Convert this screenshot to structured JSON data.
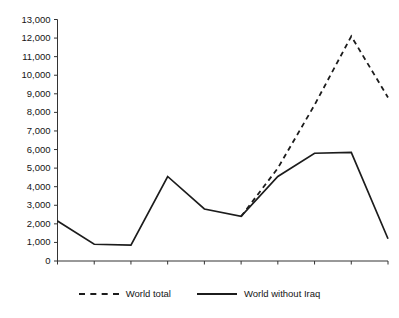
{
  "figure": {
    "clipped_caption": "",
    "background_color": "#ffffff",
    "ink_color": "#1c1c1c"
  },
  "legend": {
    "position": "bottom-center",
    "entries": [
      {
        "label": "World total",
        "style": "dashed",
        "swatch_name": "dashed-line-swatch"
      },
      {
        "label": "World without Iraq",
        "style": "solid",
        "swatch_name": "solid-line-swatch"
      }
    ]
  },
  "chart_data": {
    "type": "line",
    "title": "",
    "subtitle": "",
    "xlabel": "",
    "ylabel": "",
    "categories": [
      "1998",
      "1999",
      "2000",
      "2001",
      "2002",
      "2003",
      "2004",
      "2005",
      "2006",
      "2007"
    ],
    "x": [
      1998,
      1999,
      2000,
      2001,
      2002,
      2003,
      2004,
      2005,
      2006,
      2007
    ],
    "xlim": [
      1998,
      2007
    ],
    "ylim": [
      0,
      13000
    ],
    "ytick_values": [
      0,
      1000,
      2000,
      3000,
      4000,
      5000,
      6000,
      7000,
      8000,
      9000,
      10000,
      11000,
      12000,
      13000
    ],
    "ytick_labels": [
      "0",
      "1,000",
      "2,000",
      "3,000",
      "4,000",
      "5,000",
      "6,000",
      "7,000",
      "8,000",
      "9,000",
      "10,000",
      "11,000",
      "12,000",
      "13,000"
    ],
    "xtick_labels": [
      "1998",
      "1999",
      "2000",
      "2001",
      "2002",
      "2003",
      "2004",
      "2005",
      "2006",
      "2007"
    ],
    "grid": false,
    "legend_position": "bottom",
    "series": [
      {
        "name": "World total",
        "style": "dashed",
        "x": [
          2003,
          2004,
          2005,
          2006,
          2007
        ],
        "values": [
          2400,
          5000,
          8400,
          12100,
          8800
        ]
      },
      {
        "name": "World without Iraq",
        "style": "solid",
        "x": [
          1998,
          1999,
          2000,
          2001,
          2002,
          2003,
          2004,
          2005,
          2006,
          2007
        ],
        "values": [
          2150,
          900,
          850,
          4550,
          2800,
          2400,
          4550,
          5800,
          5850,
          1200
        ]
      }
    ]
  }
}
